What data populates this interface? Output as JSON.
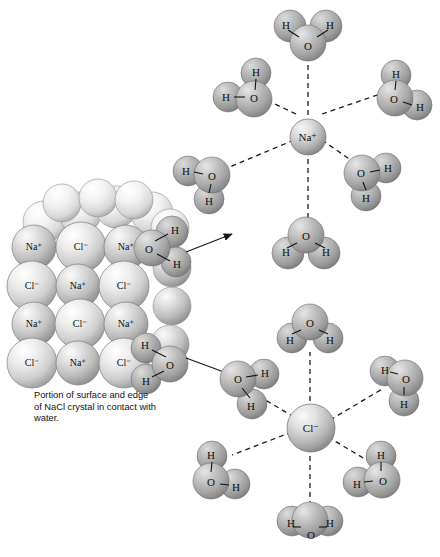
{
  "figure": {
    "caption": "Portion of surface and edge of NaCl crystal in contact with water.",
    "background_color": "#ffffff"
  },
  "labels": {
    "sodium_ion": "Na⁺",
    "chloride_ion": "Cl⁻",
    "oxygen": "O",
    "hydrogen": "H"
  },
  "colors": {
    "sphere_light": "#e9e9e9",
    "sphere_mid": "#b9b9b9",
    "sphere_dark": "#8f8f8f",
    "water_mid": "#a8a8a8",
    "outline": "#5a5a5a",
    "bond": "#1a1a1a",
    "arrow": "#1a1a1a"
  },
  "crystal": {
    "name": "nacl-crystal-lattice",
    "rows": [
      {
        "ions": [
          "Na⁺",
          "Cl⁻",
          "Na⁺"
        ]
      },
      {
        "ions": [
          "Cl⁻",
          "Na⁺",
          "Cl⁻"
        ]
      },
      {
        "ions": [
          "Na⁺",
          "Cl⁻",
          "Na⁺"
        ]
      },
      {
        "ions": [
          "Cl⁻",
          "Na⁺",
          "Cl⁻"
        ]
      }
    ],
    "edge_waters": [
      {
        "name": "edge-water-upper",
        "atoms": [
          "O",
          "H",
          "H"
        ]
      },
      {
        "name": "edge-water-lower",
        "atoms": [
          "H",
          "O",
          "H"
        ]
      }
    ]
  },
  "complexes": [
    {
      "name": "hydrated-sodium-ion",
      "center_label": "Na⁺",
      "center_kind": "cation",
      "water_count": 6,
      "orientation_note": "oxygen atoms point toward the cation",
      "waters": [
        {
          "position": "top",
          "atoms": [
            "H",
            "O",
            "H"
          ]
        },
        {
          "position": "upper-left",
          "atoms": [
            "H",
            "H",
            "O"
          ]
        },
        {
          "position": "upper-right",
          "atoms": [
            "H",
            "O",
            "H"
          ]
        },
        {
          "position": "left",
          "atoms": [
            "H",
            "O",
            "H"
          ]
        },
        {
          "position": "lower-right",
          "atoms": [
            "O",
            "H",
            "H"
          ]
        },
        {
          "position": "bottom",
          "atoms": [
            "H",
            "O",
            "H"
          ]
        }
      ]
    },
    {
      "name": "hydrated-chloride-ion",
      "center_label": "Cl⁻",
      "center_kind": "anion",
      "water_count": 6,
      "orientation_note": "hydrogen atoms point toward the anion",
      "waters": [
        {
          "position": "top",
          "atoms": [
            "H",
            "O",
            "H"
          ]
        },
        {
          "position": "upper-left",
          "atoms": [
            "O",
            "H",
            "H"
          ]
        },
        {
          "position": "upper-right",
          "atoms": [
            "H",
            "O",
            "H"
          ]
        },
        {
          "position": "lower-left",
          "atoms": [
            "H",
            "O",
            "H"
          ]
        },
        {
          "position": "lower-right",
          "atoms": [
            "H",
            "O",
            "H"
          ]
        },
        {
          "position": "bottom",
          "atoms": [
            "H",
            "O",
            "H"
          ]
        }
      ]
    }
  ],
  "arrows": [
    {
      "name": "arrow-to-sodium-complex",
      "from": "crystal",
      "to": "hydrated-sodium-ion"
    },
    {
      "name": "arrow-to-chloride-complex",
      "from": "crystal",
      "to": "hydrated-chloride-ion"
    }
  ]
}
